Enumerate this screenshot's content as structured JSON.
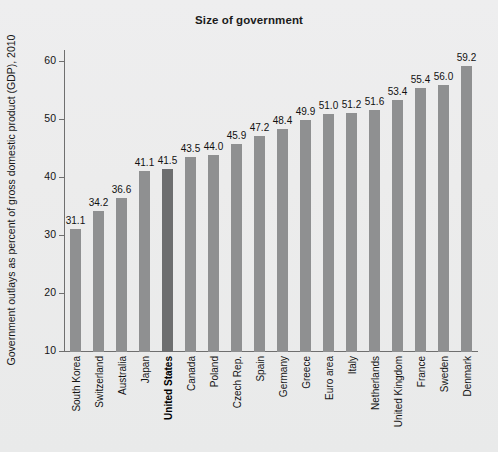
{
  "chart_data": {
    "type": "bar",
    "title": "Size of government",
    "xlabel": "",
    "ylabel": "Government outlays as percent of gross domestic product (GDP), 2010",
    "ylim": [
      10,
      62
    ],
    "yticks": [
      10,
      20,
      30,
      40,
      50,
      60
    ],
    "ytick_labels": [
      "10",
      "20",
      "30",
      "40",
      "50",
      "60"
    ],
    "grid": false,
    "legend": null,
    "bar_color": "#8f9091",
    "highlight_color": "#6d6e6f",
    "highlight_category": "United States",
    "categories": [
      "South Korea",
      "Switzerland",
      "Australia",
      "Japan",
      "United States",
      "Canada",
      "Poland",
      "Czech Rep.",
      "Spain",
      "Germany",
      "Greece",
      "Euro area",
      "Italy",
      "Netherlands",
      "United Kingdom",
      "France",
      "Sweden",
      "Denmark"
    ],
    "values": [
      31.1,
      34.2,
      36.6,
      41.1,
      41.5,
      43.5,
      44.0,
      45.9,
      47.2,
      48.4,
      49.9,
      51.0,
      51.2,
      51.6,
      53.4,
      55.4,
      56.0,
      59.2
    ],
    "value_labels": [
      "31.1",
      "34.2",
      "36.6",
      "41.1",
      "41.5",
      "43.5",
      "44.0",
      "45.9",
      "47.2",
      "48.4",
      "49.9",
      "51.0",
      "51.2",
      "51.6",
      "53.4",
      "55.4",
      "56.0",
      "59.2"
    ],
    "bold_labels": [
      "United States"
    ]
  },
  "colors": {
    "background": "#eceded",
    "axis": "#6f6f6f",
    "text": "#141414",
    "bar": "#8f9091",
    "bar_highlight": "#6d6e6f"
  }
}
